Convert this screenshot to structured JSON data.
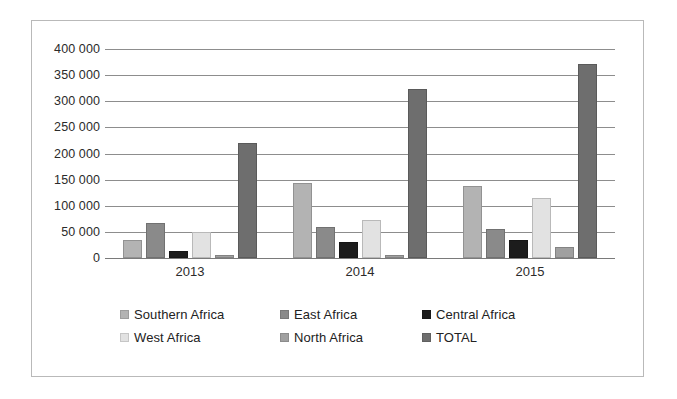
{
  "chart_data": {
    "type": "bar",
    "title": "",
    "subtitle": "",
    "xlabel": "",
    "ylabel": "",
    "categories": [
      "2013",
      "2014",
      "2015"
    ],
    "ylim": [
      0,
      400000
    ],
    "ytick_labels": [
      "400 000",
      "350 000",
      "300 000",
      "250 000",
      "200 000",
      "150 000",
      "100 000",
      "50 000",
      "0"
    ],
    "ytick_values": [
      400000,
      350000,
      300000,
      250000,
      200000,
      150000,
      100000,
      50000,
      0
    ],
    "grid": true,
    "grid_axis": "y",
    "legend_position": "bottom",
    "series": [
      {
        "name": "Southern Africa",
        "color": "#b3b3b3",
        "values": [
          35000,
          143000,
          137000
        ]
      },
      {
        "name": "East Africa",
        "color": "#8a8a8a",
        "values": [
          67000,
          60000,
          55000
        ]
      },
      {
        "name": "Central Africa",
        "color": "#1c1c1c",
        "values": [
          14000,
          30000,
          34000
        ]
      },
      {
        "name": "West Africa",
        "color": "#e2e2e2",
        "values": [
          49000,
          73000,
          115000
        ]
      },
      {
        "name": "North Africa",
        "color": "#a0a0a0",
        "values": [
          5000,
          6000,
          22000
        ]
      },
      {
        "name": "TOTAL",
        "color": "#6e6e6e",
        "values": [
          220000,
          324000,
          372000
        ]
      }
    ]
  },
  "legend": {
    "rows": [
      [
        {
          "label": "Southern Africa",
          "color": "#b3b3b3"
        },
        {
          "label": "East Africa",
          "color": "#8a8a8a"
        },
        {
          "label": "Central Africa",
          "color": "#1c1c1c"
        }
      ],
      [
        {
          "label": "West Africa",
          "color": "#e2e2e2"
        },
        {
          "label": "North Africa",
          "color": "#a0a0a0"
        },
        {
          "label": "TOTAL",
          "color": "#6e6e6e"
        }
      ]
    ]
  },
  "colors": {
    "gridline": "#8d8d8d",
    "frame_border": "#b9b9b9",
    "axis_text": "#2b2b2b",
    "background": "#ffffff"
  }
}
